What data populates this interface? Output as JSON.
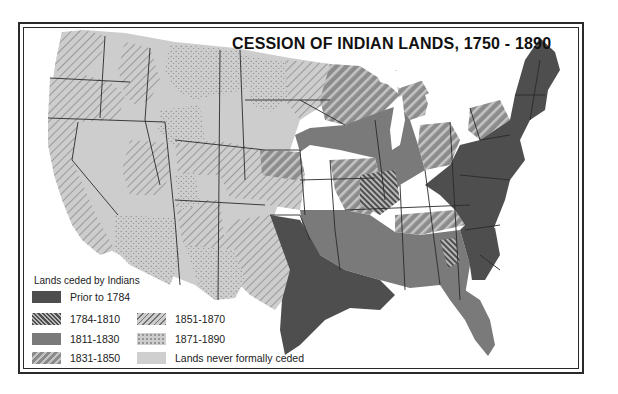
{
  "map": {
    "title": "CESSION OF INDIAN LANDS, 1750 - 1890",
    "region": "United States (contiguous)",
    "legend": {
      "title": "Lands ceded by Indians",
      "items": [
        {
          "label": "Prior to 1784",
          "pattern": "solid-dark",
          "color": "#4e4e4e"
        },
        {
          "label": "1784-1810",
          "pattern": "dense-backslash-hatch",
          "color": "#5a5a5a"
        },
        {
          "label": "1811-1830",
          "pattern": "solid-medium",
          "color": "#7a7a7a"
        },
        {
          "label": "1831-1850",
          "pattern": "wide-slash-hatch",
          "color": "#8a8a8a"
        },
        {
          "label": "1851-1870",
          "pattern": "thin-slash-hatch",
          "color": "#bdbdbd"
        },
        {
          "label": "1871-1890",
          "pattern": "stipple-dots",
          "color": "#c8c8c8"
        },
        {
          "label": "Lands never formally ceded",
          "pattern": "solid-light",
          "color": "#cfcfcf"
        }
      ]
    },
    "colors": {
      "prior_1784": "#4e4e4e",
      "c1811_1830": "#7a7a7a",
      "light_fill": "#cdcdcd",
      "hatch_line": "#7d7d7d",
      "border_line": "#2a2a2a",
      "water": "#ffffff"
    }
  }
}
